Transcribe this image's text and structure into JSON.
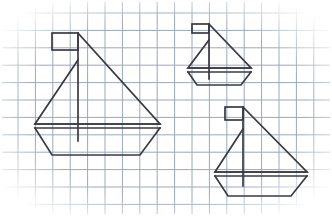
{
  "figure": {
    "width": 332,
    "height": 216,
    "background_color": "#ffffff"
  },
  "grid": {
    "name": "graph-paper-grid",
    "line_color": "#9aa8bc",
    "line_width": 1,
    "cell_size": 17.4,
    "origin_x": 18.0,
    "origin_y": 13.0,
    "columns": 17,
    "rows": 11,
    "x_min": 18.0,
    "x_max": 314.0,
    "y_min": 13.0,
    "y_max": 204.0,
    "fade_edges": true
  },
  "style": {
    "stroke_color": "#3a3a44",
    "stroke_width": 1.7,
    "fill": "none",
    "line_join": "miter"
  },
  "boats": [
    {
      "id": "boat-large-left",
      "label": "Large sailboat (left)",
      "size": "large",
      "scale": 1.0,
      "mast": {
        "x": 78,
        "y_top": 33,
        "y_bottom": 141
      },
      "flag": {
        "x_left": 52,
        "y_top": 33,
        "x_right": 78,
        "y_bottom": 50
      },
      "sail_main": {
        "apex_x": 78,
        "apex_y": 33,
        "corner_x": 160,
        "corner_y": 124
      },
      "sail_front": {
        "apex_x": 78,
        "apex_y": 60,
        "base_left_x": 35,
        "base_y": 124
      },
      "boom": {
        "x_left": 35,
        "x_right": 160,
        "y": 124
      },
      "deck": {
        "x_left": 35,
        "x_right": 160,
        "y": 128
      },
      "hull": {
        "top_left_x": 35,
        "top_right_x": 160,
        "top_y": 128,
        "bottom_left_x": 52,
        "bottom_right_x": 140,
        "bottom_y": 155
      }
    },
    {
      "id": "boat-small-top-right",
      "label": "Small sailboat (upper right)",
      "size": "small",
      "scale": 0.52,
      "mast": {
        "x": 209,
        "y_top": 24,
        "y_bottom": 79
      },
      "flag": {
        "x_left": 192,
        "y_top": 24,
        "x_right": 209,
        "y_bottom": 33
      },
      "sail_main": {
        "apex_x": 209,
        "apex_y": 24,
        "corner_x": 251,
        "corner_y": 68
      },
      "sail_front": {
        "apex_x": 209,
        "apex_y": 40,
        "base_left_x": 188,
        "base_y": 68
      },
      "boom": {
        "x_left": 188,
        "x_right": 251,
        "y": 68
      },
      "deck": {
        "x_left": 188,
        "x_right": 251,
        "y": 72
      },
      "hull": {
        "top_left_x": 188,
        "top_right_x": 251,
        "top_y": 72,
        "bottom_left_x": 197,
        "bottom_right_x": 241,
        "bottom_y": 85
      }
    },
    {
      "id": "boat-medium-bottom-right",
      "label": "Medium sailboat (lower right)",
      "size": "medium",
      "scale": 0.76,
      "mast": {
        "x": 243,
        "y_top": 107,
        "y_bottom": 186
      },
      "flag": {
        "x_left": 225,
        "y_top": 107,
        "x_right": 243,
        "y_bottom": 120
      },
      "sail_main": {
        "apex_x": 243,
        "apex_y": 107,
        "corner_x": 307,
        "corner_y": 172
      },
      "sail_front": {
        "apex_x": 243,
        "apex_y": 129,
        "base_left_x": 215,
        "base_y": 172
      },
      "boom": {
        "x_left": 215,
        "x_right": 307,
        "y": 172
      },
      "deck": {
        "x_left": 215,
        "x_right": 307,
        "y": 176
      },
      "hull": {
        "top_left_x": 215,
        "top_right_x": 307,
        "top_y": 176,
        "bottom_left_x": 228,
        "bottom_right_x": 291,
        "bottom_y": 196
      }
    }
  ]
}
